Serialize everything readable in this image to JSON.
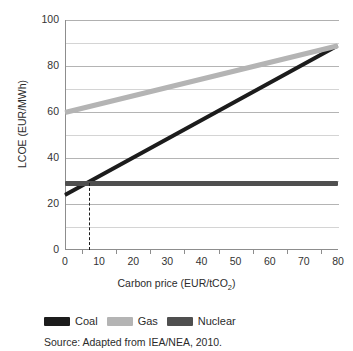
{
  "chart_data": {
    "type": "line",
    "title": "",
    "xlabel": "Carbon price (EUR/tCO2)",
    "xlabel_main": "Carbon price (EUR/tCO",
    "xlabel_sub": "2",
    "xlabel_tail": ")",
    "ylabel": "LCOE (EUR/MWh)",
    "xlim": [
      0,
      80
    ],
    "ylim": [
      0,
      100
    ],
    "xticks": [
      0,
      10,
      20,
      30,
      40,
      50,
      60,
      70,
      80
    ],
    "yticks": [
      0,
      20,
      40,
      60,
      80,
      100
    ],
    "ygridlines": [
      0,
      10,
      20,
      30,
      40,
      50,
      60,
      70,
      80,
      90,
      100
    ],
    "grid": true,
    "legend_position": "below-plot",
    "series": [
      {
        "name": "Coal",
        "color": "#1c1c1c",
        "x": [
          0,
          80
        ],
        "values": [
          24,
          89
        ]
      },
      {
        "name": "Gas",
        "color": "#b4b4b4",
        "x": [
          0,
          80
        ],
        "values": [
          60,
          89
        ]
      },
      {
        "name": "Nuclear",
        "color": "#4f4f4f",
        "x": [
          0,
          80
        ],
        "values": [
          29,
          29
        ]
      }
    ],
    "annotations": [
      {
        "type": "vertical-dashed-line",
        "name": "coal-nuclear-crossover",
        "x": 7,
        "y_from": 0,
        "y_to": 29,
        "color": "#1a1a1a"
      }
    ],
    "source": "Source: Adapted from IEA/NEA, 2010."
  },
  "axes": {
    "y_title": "LCOE (EUR/MWh)",
    "y_tick_labels": [
      "0",
      "20",
      "40",
      "60",
      "80",
      "100"
    ],
    "x_tick_labels": [
      "0",
      "10",
      "20",
      "30",
      "40",
      "50",
      "60",
      "70",
      "80"
    ]
  },
  "legend": {
    "items": [
      {
        "label": "Coal",
        "color": "#1c1c1c"
      },
      {
        "label": "Gas",
        "color": "#b4b4b4"
      },
      {
        "label": "Nuclear",
        "color": "#4f4f4f"
      }
    ]
  },
  "footer": {
    "source": "Source: Adapted from IEA/NEA, 2010."
  }
}
